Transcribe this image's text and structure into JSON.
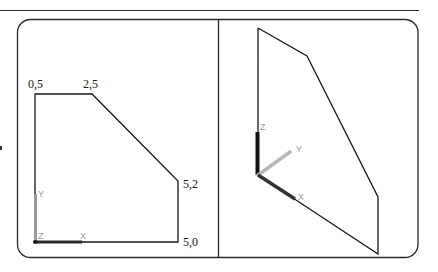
{
  "figure": {
    "panels": [
      {
        "id": "top-view",
        "view": "2D sketch",
        "vertex_labels": [
          {
            "text": "0,5"
          },
          {
            "text": "2,5"
          },
          {
            "text": "5,2"
          },
          {
            "text": "5,0"
          }
        ],
        "axes": {
          "x": "X",
          "y": "Y",
          "z": "Z"
        }
      },
      {
        "id": "iso-view",
        "view": "isometric",
        "axes": {
          "x": "X",
          "y": "Y",
          "z": "Z"
        }
      }
    ],
    "colors": {
      "stroke": "#1a1a1a",
      "axis_dark": "#222222",
      "axis_light": "#b0b0b0",
      "axis_label": "#9a9a9a"
    }
  }
}
